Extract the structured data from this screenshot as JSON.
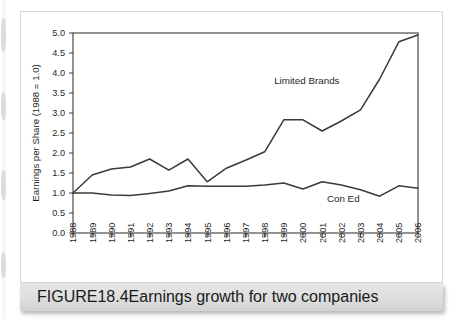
{
  "figure": {
    "caption_label": "FIGURE",
    "caption_number": "18.4",
    "caption_text": "Earnings growth for two companies"
  },
  "chart_data": {
    "type": "line",
    "title": "",
    "xlabel": "",
    "ylabel": "Earnings per Share (1988 = 1.0)",
    "xlim": [
      1988,
      2006
    ],
    "ylim": [
      0.0,
      5.0
    ],
    "grid": false,
    "legend_position": "inline-annotations",
    "x": [
      1988,
      1989,
      1990,
      1991,
      1992,
      1993,
      1994,
      1995,
      1996,
      1997,
      1998,
      1999,
      2000,
      2001,
      2002,
      2003,
      2004,
      2005,
      2006
    ],
    "categories": [
      "1988",
      "1989",
      "1990",
      "1991",
      "1992",
      "1993",
      "1994",
      "1995",
      "1996",
      "1997",
      "1998",
      "1999",
      "2000",
      "2001",
      "2002",
      "2003",
      "2004",
      "2005",
      "2006"
    ],
    "ytick_labels": [
      "0.0",
      "0.5",
      "1.0",
      "1.5",
      "2.0",
      "2.5",
      "3.0",
      "3.5",
      "4.0",
      "4.5",
      "5.0"
    ],
    "yticks": [
      0.0,
      0.5,
      1.0,
      1.5,
      2.0,
      2.5,
      3.0,
      3.5,
      4.0,
      4.5,
      5.0
    ],
    "series": [
      {
        "name": "Limited Brands",
        "color": "#3a3a3a",
        "values": [
          1.0,
          1.45,
          1.6,
          1.65,
          1.85,
          1.57,
          1.85,
          1.28,
          1.62,
          1.82,
          2.03,
          2.83,
          2.83,
          2.55,
          2.8,
          3.08,
          3.85,
          4.78,
          4.95
        ]
      },
      {
        "name": "Con Ed",
        "color": "#3a3a3a",
        "values": [
          1.0,
          1.0,
          0.95,
          0.94,
          0.99,
          1.05,
          1.18,
          1.17,
          1.17,
          1.17,
          1.2,
          1.25,
          1.1,
          1.28,
          1.2,
          1.08,
          0.92,
          1.18,
          1.12
        ]
      }
    ],
    "annotations": [
      {
        "text": "Limited Brands",
        "x": 2000.2,
        "y": 3.72
      },
      {
        "text": "Con Ed",
        "x": 2002.1,
        "y": 0.78
      }
    ]
  }
}
